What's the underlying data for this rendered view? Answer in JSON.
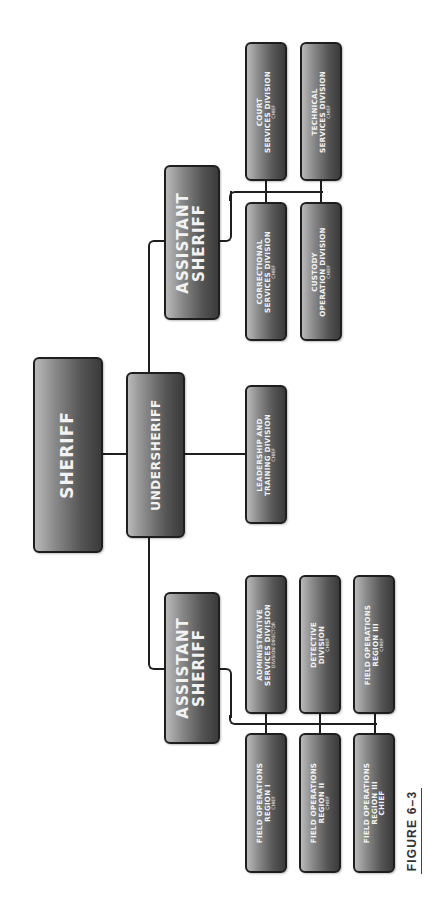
{
  "figure_label": "FIGURE 6–3",
  "colors": {
    "box_border": "#1e1e1e",
    "box_gradient_light": "#b9b9b9",
    "box_gradient_dark": "#3b3b3b",
    "box_text": "#f2f2f2",
    "connector": "#1e1e1e",
    "background": "#ffffff"
  },
  "orientation": "rotated -90deg (read bottom-to-top)",
  "nodes": {
    "sheriff": {
      "title": "SHERIFF"
    },
    "undersheriff": {
      "title": "UNDERSHERIFF"
    },
    "assistant_sheriff_top": {
      "line1": "ASSISTANT",
      "line2": "SHERIFF"
    },
    "assistant_sheriff_bottom": {
      "line1": "ASSISTANT",
      "line2": "SHERIFF"
    },
    "leadership": {
      "line1": "LEADERSHIP AND",
      "line2": "TRAINING DIVISION",
      "role": "CHIEF"
    },
    "court": {
      "line1": "COURT",
      "line2": "SERVICES DIVISION",
      "role": "CHIEF"
    },
    "technical": {
      "line1": "TECHNICAL",
      "line2": "SERVICES DIVISION",
      "role": "CHIEF"
    },
    "correctional": {
      "line1": "CORRECTIONAL",
      "line2": "SERVICES DIVISION",
      "role": "CHIEF"
    },
    "custody": {
      "line1": "CUSTODY",
      "line2": "OPERATION DIVISION",
      "role": "CHIEF"
    },
    "administrative": {
      "line1": "ADMINISTRATIVE",
      "line2": "SERVICES DIVISION",
      "role": "DIVISION DIRECTOR"
    },
    "detective": {
      "line1": "DETECTIVE",
      "line2": "DIVISION",
      "role": "CHIEF"
    },
    "field_ops_iii_upper": {
      "line1": "FIELD OPERATIONS",
      "line2": "REGION III",
      "role": "CHIEF"
    },
    "field_ops_i": {
      "line1": "FIELD OPERATIONS",
      "line2": "REGION I",
      "role": "CHIEF"
    },
    "field_ops_ii": {
      "line1": "FIELD OPERATIONS",
      "line2": "REGION II",
      "role": "CHIEF"
    },
    "field_ops_iii_lower": {
      "line1": "FIELD OPERATIONS",
      "line2": "REGION III",
      "role": "CHIEF"
    }
  },
  "edges": [
    [
      "sheriff",
      "undersheriff"
    ],
    [
      "undersheriff",
      "assistant_sheriff_top"
    ],
    [
      "undersheriff",
      "leadership"
    ],
    [
      "undersheriff",
      "assistant_sheriff_bottom"
    ],
    [
      "assistant_sheriff_top",
      "court"
    ],
    [
      "assistant_sheriff_top",
      "technical"
    ],
    [
      "assistant_sheriff_top",
      "correctional"
    ],
    [
      "assistant_sheriff_top",
      "custody"
    ],
    [
      "assistant_sheriff_bottom",
      "administrative"
    ],
    [
      "assistant_sheriff_bottom",
      "detective"
    ],
    [
      "assistant_sheriff_bottom",
      "field_ops_iii_upper"
    ],
    [
      "assistant_sheriff_bottom",
      "field_ops_i"
    ],
    [
      "assistant_sheriff_bottom",
      "field_ops_ii"
    ],
    [
      "assistant_sheriff_bottom",
      "field_ops_iii_lower"
    ]
  ]
}
